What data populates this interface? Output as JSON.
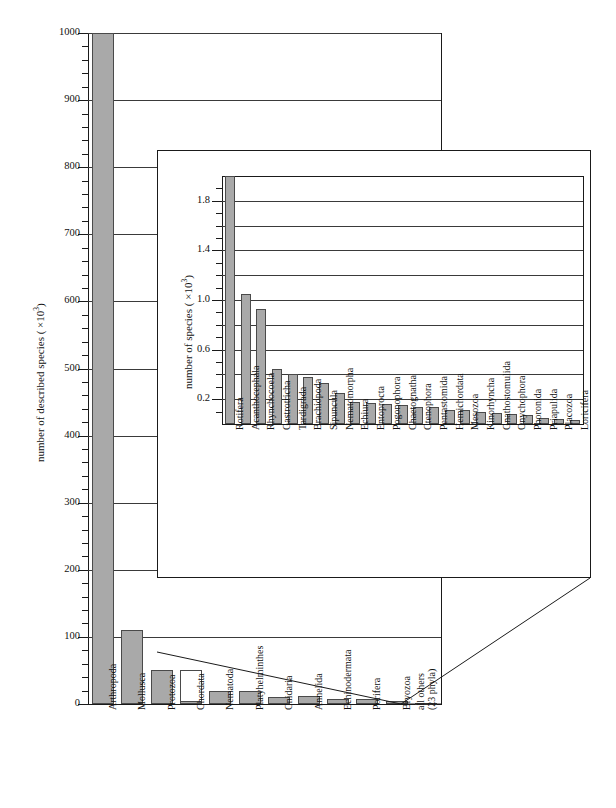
{
  "figure": {
    "main_axis_title_pre": "number of described species ( ×10",
    "main_axis_title_exp": "3",
    "main_axis_title_post": ")",
    "inset_axis_title_pre": "number of species ( ×10",
    "inset_axis_title_exp": "3",
    "inset_axis_title_post": ")"
  },
  "chart_data": [
    {
      "type": "bar",
      "id": "main",
      "title": "",
      "xlabel": "",
      "ylabel": "number of described species ( ×10^3)",
      "ylim": [
        0,
        1000
      ],
      "yticks": [
        0,
        100,
        200,
        300,
        400,
        500,
        600,
        700,
        800,
        900,
        1000
      ],
      "ytick_labels": [
        "0",
        "100",
        "200",
        "300",
        "400",
        "500",
        "600",
        "700",
        "800",
        "900",
        "1000"
      ],
      "minor_tick_step": 20,
      "grid": true,
      "categories": [
        "Arthropoda",
        "Mollusca",
        "Protozoa",
        "Chordata",
        "Nematoda",
        "Platyhelminthes",
        "Cnidaria",
        "Annelida",
        "Echinodermata",
        "Porifera",
        "Bryozoa",
        "all others\n(23 phyla)"
      ],
      "values": [
        1000,
        110,
        50,
        50,
        20,
        20,
        11,
        12,
        7,
        8,
        4,
        2
      ],
      "bar_styles": [
        "filled",
        "filled",
        "filled",
        "hollow",
        "filled",
        "filled",
        "filled",
        "filled",
        "filled",
        "filled",
        "filled",
        "filled"
      ],
      "hollow_base_values": [
        0,
        0,
        0,
        5,
        0,
        0,
        0,
        0,
        0,
        0,
        0,
        0
      ],
      "note": "Arthropoda bar is clipped at the 1000 axis maximum; Chordata is drawn hollow with a small filled base representing vertebrates."
    },
    {
      "type": "bar",
      "id": "inset",
      "title": "",
      "xlabel": "",
      "ylabel": "number of species ( ×10^3)",
      "ylim": [
        0,
        2.0
      ],
      "yticks": [
        0.2,
        0.6,
        1.0,
        1.4,
        1.8
      ],
      "ytick_labels": [
        "0.2",
        "0.6",
        "1.0",
        "1.4",
        "1.8"
      ],
      "minor_tick_step": 0.1,
      "grid": true,
      "categories": [
        "Rotifera",
        "Acanthocephala",
        "Rhynchocoela",
        "Gastrotricha",
        "Tardigrada",
        "Brachiopoda",
        "Sipuncula",
        "Nematomorpha",
        "Echiura",
        "Entoprocta",
        "Pogonophora",
        "Chaetognatha",
        "Ctenophora",
        "Pentastomida",
        "Hemichordata",
        "Mesozoa",
        "Kinorhyncha",
        "Gnathostomulida",
        "Onychophora",
        "Phoronida",
        "Priapulida",
        "Placozoa",
        "Loricifera"
      ],
      "values": [
        2.0,
        1.05,
        0.93,
        0.44,
        0.4,
        0.38,
        0.33,
        0.25,
        0.18,
        0.17,
        0.16,
        0.15,
        0.14,
        0.14,
        0.11,
        0.11,
        0.1,
        0.09,
        0.08,
        0.07,
        0.05,
        0.04,
        0.03
      ],
      "note": "Rotifera bar is clipped at the 2.0 axis maximum."
    }
  ]
}
